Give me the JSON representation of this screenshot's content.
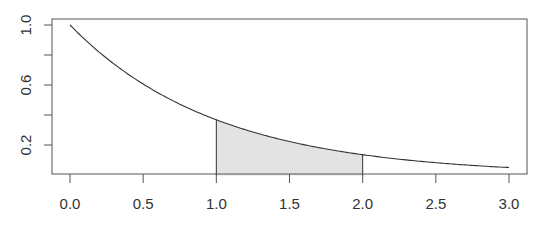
{
  "chart_data": {
    "type": "area",
    "title": "",
    "xlabel": "",
    "ylabel": "",
    "function": "exp(-x)",
    "xlim": [
      0,
      3
    ],
    "ylim": [
      0,
      1
    ],
    "x_ticks": [
      "0.0",
      "0.5",
      "1.0",
      "1.5",
      "2.0",
      "2.5",
      "3.0"
    ],
    "y_ticks": [
      "0.2",
      "0.4",
      "0.6",
      "0.8",
      "1.0"
    ],
    "y_tick_labels_shown": [
      "1.0",
      "0.6",
      "0.2"
    ],
    "grid": false,
    "legend": null,
    "series": [
      {
        "name": "curve",
        "x": [
          0,
          0.25,
          0.5,
          0.75,
          1.0,
          1.25,
          1.5,
          1.75,
          2.0,
          2.25,
          2.5,
          2.75,
          3.0
        ],
        "y": [
          1.0,
          0.779,
          0.607,
          0.472,
          0.368,
          0.287,
          0.223,
          0.174,
          0.135,
          0.105,
          0.082,
          0.064,
          0.05
        ]
      }
    ],
    "shaded_region": {
      "x_from": 1.0,
      "x_to": 2.0,
      "fill": "#e3e3e3"
    }
  },
  "colors": {
    "axis": "#555555",
    "curve": "#333333",
    "shade": "#e3e3e3",
    "label": "#333333"
  }
}
